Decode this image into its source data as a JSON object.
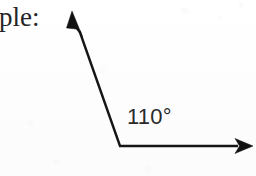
{
  "figure": {
    "kind": "geometry-angle-diagram",
    "background_color": "#fefefe",
    "ink_color": "#151515",
    "caption": {
      "text": "ple:",
      "note_full_word": "Example:",
      "font_style": "serif",
      "color": "#252525"
    },
    "angle_label": {
      "value": "110",
      "unit": "°",
      "text": "110°",
      "font_style": "sans-serif",
      "color": "#2a2a2a"
    },
    "vertex": {
      "x": 120,
      "y": 146
    },
    "rays": [
      {
        "name": "upper-ray",
        "from": {
          "x": 120,
          "y": 146
        },
        "to": {
          "x": 73,
          "y": 13
        },
        "direction_degrees": 109,
        "arrowhead": "filled-triangle"
      },
      {
        "name": "horizontal-ray",
        "from": {
          "x": 120,
          "y": 146
        },
        "to": {
          "x": 253,
          "y": 146
        },
        "direction_degrees": 0,
        "arrowhead": "filled-triangle"
      }
    ],
    "measure_degrees": 110,
    "canvas": {
      "width": 256,
      "height": 176
    }
  }
}
